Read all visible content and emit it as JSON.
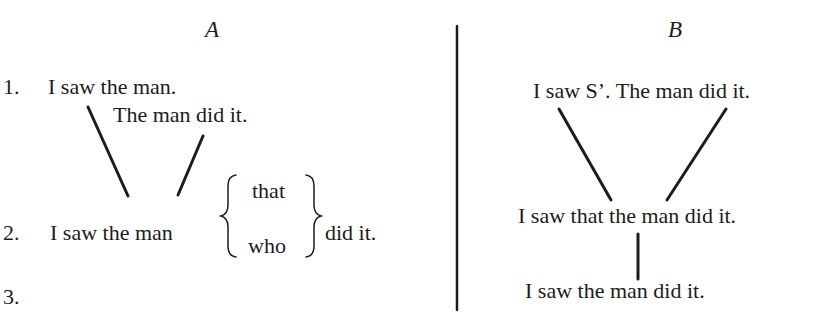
{
  "panel_a": {
    "heading": "A",
    "row1": {
      "number": "1.",
      "sentence_main": "I saw the man.",
      "sentence_sub": "The man did it."
    },
    "row2": {
      "number": "2.",
      "sentence_left": "I saw the man",
      "brace_options": [
        "that",
        "who"
      ],
      "sentence_right": "did it."
    },
    "row3": {
      "number": "3."
    }
  },
  "panel_b": {
    "heading": "B",
    "row1": {
      "sentence": "I saw S’. The man did it."
    },
    "row2": {
      "sentence": "I saw that the man did it."
    },
    "row3": {
      "sentence": "I saw the man did it."
    }
  },
  "colors": {
    "ink": "#1c1c1c",
    "background": "#ffffff"
  }
}
